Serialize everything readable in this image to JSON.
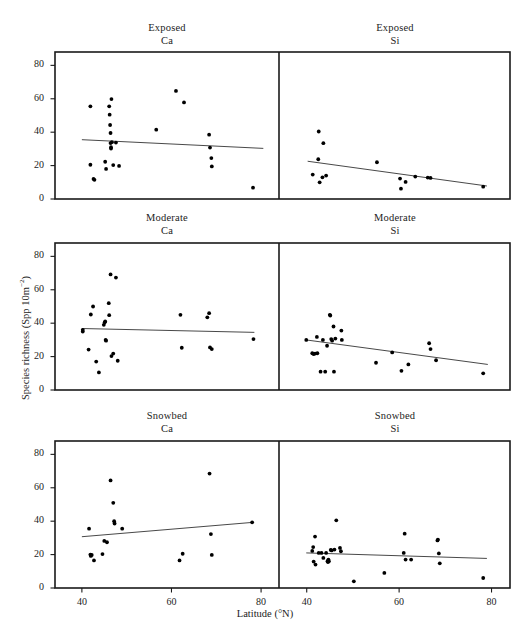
{
  "figure": {
    "xlabel": "Latitude (°N)",
    "ylabel_main": "Species richness (Spp 10m",
    "ylabel_exp": "−2",
    "ylabel_close": ")",
    "ylabel_full": "Species richness (Spp 10m−2)",
    "background": "#ffffff",
    "ink": "#1a1a1a",
    "point_color": "#000000",
    "line_color": "#333333"
  },
  "axes": {
    "xticks": [
      40,
      60,
      80
    ],
    "xticklabels": [
      "40",
      "60",
      "80"
    ],
    "yticks": [
      0,
      20,
      40,
      60,
      80
    ],
    "yticklabels": [
      "0",
      "20",
      "40",
      "60",
      "80"
    ],
    "xlim": [
      34,
      84
    ],
    "ylim": [
      0,
      88
    ],
    "grid": false
  },
  "chart_data": {
    "type": "scatter",
    "title": "",
    "xlabel": "Latitude (°N)",
    "ylabel": "Species richness (Spp 10m−2)",
    "xlim": [
      34,
      84
    ],
    "ylim": [
      0,
      88
    ],
    "xticks": [
      40,
      60,
      80
    ],
    "yticks": [
      0,
      20,
      40,
      60,
      80
    ],
    "grid": false,
    "legend": "none",
    "layout": "3 rows x 2 columns; rows = Exposed / Moderate / Snowbed; columns = Ca / Si",
    "panels": [
      {
        "row": 0,
        "col": 0,
        "title_line1": "Exposed",
        "title_line2": "Ca",
        "habitat": "Exposed",
        "bedrock": "Ca",
        "trend": {
          "x1": 40.0,
          "y1": 35.5,
          "x2": 80.5,
          "y2": 30.3,
          "slope": -0.128
        },
        "points": [
          [
            41.9,
            55.5
          ],
          [
            41.9,
            20.5
          ],
          [
            42.6,
            12.0
          ],
          [
            42.8,
            11.5
          ],
          [
            45.2,
            22.3
          ],
          [
            45.4,
            18.0
          ],
          [
            46.1,
            55.5
          ],
          [
            46.2,
            50.5
          ],
          [
            46.3,
            44.3
          ],
          [
            46.4,
            39.5
          ],
          [
            46.4,
            33.5
          ],
          [
            46.5,
            31.0
          ],
          [
            46.5,
            30.2
          ],
          [
            46.6,
            59.8
          ],
          [
            46.7,
            34.0
          ],
          [
            47.0,
            20.3
          ],
          [
            47.6,
            33.8
          ],
          [
            48.3,
            19.8
          ],
          [
            56.6,
            41.5
          ],
          [
            61.0,
            64.7
          ],
          [
            62.8,
            57.8
          ],
          [
            68.4,
            38.5
          ],
          [
            68.6,
            30.8
          ],
          [
            68.9,
            24.5
          ],
          [
            69.0,
            19.5
          ],
          [
            78.2,
            6.8
          ]
        ]
      },
      {
        "row": 0,
        "col": 1,
        "title_line1": "Exposed",
        "title_line2": "Si",
        "habitat": "Exposed",
        "bedrock": "Si",
        "trend": {
          "x1": 40.2,
          "y1": 22.6,
          "x2": 79.0,
          "y2": 7.8,
          "slope": -0.382
        },
        "points": [
          [
            41.3,
            14.6
          ],
          [
            42.6,
            40.4
          ],
          [
            42.8,
            10.0
          ],
          [
            43.4,
            13.0
          ],
          [
            43.6,
            33.4
          ],
          [
            44.2,
            14.0
          ],
          [
            42.5,
            23.8
          ],
          [
            55.2,
            22.0
          ],
          [
            60.2,
            12.2
          ],
          [
            60.4,
            6.2
          ],
          [
            61.4,
            10.2
          ],
          [
            63.5,
            13.4
          ],
          [
            66.2,
            12.8
          ],
          [
            66.8,
            12.6
          ],
          [
            78.2,
            7.4
          ]
        ]
      },
      {
        "row": 1,
        "col": 0,
        "title_line1": "Moderate",
        "title_line2": "Ca",
        "habitat": "Moderate",
        "bedrock": "Ca",
        "trend": {
          "x1": 40.0,
          "y1": 36.8,
          "x2": 78.5,
          "y2": 34.5,
          "slope": -0.06
        },
        "points": [
          [
            40.2,
            36.0
          ],
          [
            40.2,
            35.0
          ],
          [
            41.5,
            24.2
          ],
          [
            42.0,
            45.2
          ],
          [
            42.5,
            50.0
          ],
          [
            43.2,
            17.0
          ],
          [
            43.8,
            10.5
          ],
          [
            44.9,
            39.0
          ],
          [
            45.1,
            40.5
          ],
          [
            45.2,
            41.0
          ],
          [
            45.3,
            30.0
          ],
          [
            45.4,
            29.5
          ],
          [
            46.0,
            52.0
          ],
          [
            46.1,
            44.8
          ],
          [
            46.4,
            69.2
          ],
          [
            46.6,
            20.3
          ],
          [
            47.0,
            21.8
          ],
          [
            47.6,
            67.3
          ],
          [
            48.0,
            17.5
          ],
          [
            62.0,
            45.0
          ],
          [
            62.3,
            25.3
          ],
          [
            68.0,
            43.5
          ],
          [
            68.4,
            46.0
          ],
          [
            68.6,
            25.5
          ],
          [
            69.0,
            24.5
          ],
          [
            78.3,
            30.5
          ]
        ]
      },
      {
        "row": 1,
        "col": 1,
        "title_line1": "Moderate",
        "title_line2": "Si",
        "habitat": "Moderate",
        "bedrock": "Si",
        "trend": {
          "x1": 39.8,
          "y1": 30.0,
          "x2": 79.2,
          "y2": 15.3,
          "slope": -0.373
        },
        "points": [
          [
            39.9,
            30.0
          ],
          [
            41.2,
            22.0
          ],
          [
            41.5,
            21.5
          ],
          [
            41.8,
            21.8
          ],
          [
            42.2,
            31.8
          ],
          [
            42.3,
            22.0
          ],
          [
            43.0,
            11.0
          ],
          [
            43.5,
            30.0
          ],
          [
            44.0,
            11.0
          ],
          [
            44.4,
            26.5
          ],
          [
            45.0,
            45.0
          ],
          [
            45.1,
            44.6
          ],
          [
            45.3,
            30.5
          ],
          [
            45.5,
            29.5
          ],
          [
            45.8,
            38.0
          ],
          [
            45.9,
            11.0
          ],
          [
            46.2,
            30.8
          ],
          [
            47.5,
            35.6
          ],
          [
            47.6,
            30.0
          ],
          [
            55.0,
            16.3
          ],
          [
            58.5,
            22.5
          ],
          [
            60.5,
            11.5
          ],
          [
            62.0,
            15.3
          ],
          [
            66.5,
            28.0
          ],
          [
            66.8,
            24.5
          ],
          [
            68.0,
            17.8
          ],
          [
            78.2,
            10.0
          ]
        ]
      },
      {
        "row": 2,
        "col": 0,
        "title_line1": "Snowbed",
        "title_line2": "Ca",
        "habitat": "Snowbed",
        "bedrock": "Ca",
        "trend": {
          "x1": 40.0,
          "y1": 30.7,
          "x2": 78.2,
          "y2": 39.3,
          "slope": 0.225
        },
        "points": [
          [
            41.6,
            35.5
          ],
          [
            41.9,
            20.0
          ],
          [
            42.0,
            19.2
          ],
          [
            42.2,
            19.8
          ],
          [
            42.7,
            16.5
          ],
          [
            44.6,
            20.3
          ],
          [
            45.0,
            28.2
          ],
          [
            45.6,
            27.4
          ],
          [
            46.4,
            64.4
          ],
          [
            47.0,
            51.0
          ],
          [
            47.2,
            40.0
          ],
          [
            47.3,
            38.6
          ],
          [
            49.0,
            35.5
          ],
          [
            61.8,
            16.5
          ],
          [
            62.5,
            20.5
          ],
          [
            68.5,
            68.5
          ],
          [
            68.8,
            32.3
          ],
          [
            69.0,
            19.8
          ],
          [
            78.0,
            39.3
          ]
        ]
      },
      {
        "row": 2,
        "col": 1,
        "title_line1": "Snowbed",
        "title_line2": "Si",
        "habitat": "Snowbed",
        "bedrock": "Si",
        "trend": {
          "x1": 39.9,
          "y1": 21.0,
          "x2": 79.0,
          "y2": 17.7,
          "slope": -0.084
        },
        "points": [
          [
            41.2,
            22.2
          ],
          [
            41.4,
            24.5
          ],
          [
            41.5,
            15.8
          ],
          [
            41.8,
            30.8
          ],
          [
            41.9,
            14.0
          ],
          [
            42.6,
            21.0
          ],
          [
            43.2,
            21.0
          ],
          [
            43.6,
            18.0
          ],
          [
            44.2,
            21.0
          ],
          [
            44.5,
            16.0
          ],
          [
            44.6,
            15.5
          ],
          [
            44.7,
            17.0
          ],
          [
            44.8,
            16.0
          ],
          [
            45.2,
            22.8
          ],
          [
            45.4,
            22.5
          ],
          [
            46.0,
            23.0
          ],
          [
            46.4,
            40.5
          ],
          [
            47.2,
            24.0
          ],
          [
            47.4,
            22.0
          ],
          [
            50.2,
            4.0
          ],
          [
            56.8,
            9.0
          ],
          [
            61.0,
            21.0
          ],
          [
            61.2,
            32.5
          ],
          [
            61.4,
            17.0
          ],
          [
            62.6,
            17.0
          ],
          [
            68.3,
            28.5
          ],
          [
            68.4,
            29.0
          ],
          [
            68.6,
            20.7
          ],
          [
            68.8,
            14.8
          ],
          [
            78.2,
            6.0
          ]
        ]
      }
    ]
  }
}
